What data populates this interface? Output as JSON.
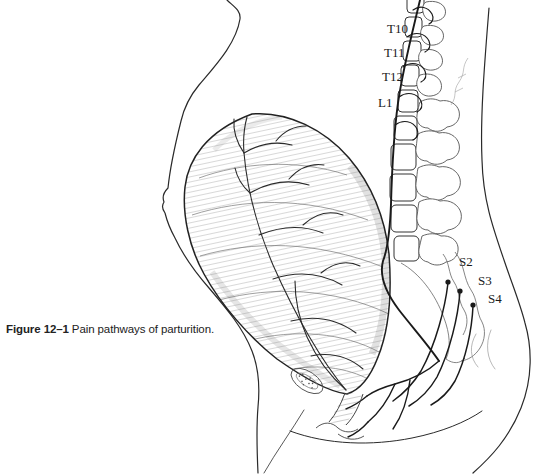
{
  "figure": {
    "caption": {
      "label": "Figure 12–1",
      "text": "Pain pathways of parturition."
    },
    "spine_labels": [
      {
        "text": "T10"
      },
      {
        "text": "T11"
      },
      {
        "text": "T12"
      },
      {
        "text": "L1"
      },
      {
        "text": "S2"
      },
      {
        "text": "S3"
      },
      {
        "text": "S4"
      }
    ],
    "colors": {
      "ink": "#1b1b1b",
      "paper": "#ffffff"
    }
  }
}
